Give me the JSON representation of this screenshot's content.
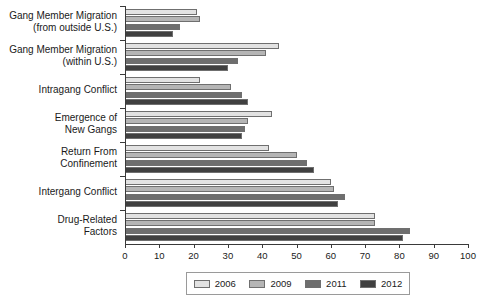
{
  "chart_data": {
    "type": "bar",
    "orientation": "horizontal",
    "title": "",
    "subtitle": "",
    "xlabel": "",
    "ylabel": "",
    "xlim": [
      0,
      100
    ],
    "xticks": [
      0,
      10,
      20,
      30,
      40,
      50,
      60,
      70,
      80,
      90,
      100
    ],
    "xtick_labels": [
      "0",
      "10",
      "20",
      "30",
      "40",
      "50",
      "60",
      "70",
      "80",
      "90",
      "100"
    ],
    "grid": false,
    "legend_position": "bottom",
    "categories": [
      "Gang Member Migration\n(from outside U.S.)",
      "Gang Member Migration\n(within U.S.)",
      "Intragang Conflict",
      "Emergence of\nNew Gangs",
      "Return From\nConfinement",
      "Intergang Conflict",
      "Drug-Related\nFactors"
    ],
    "series": [
      {
        "name": "2006",
        "color": "#e2e2e2",
        "values": [
          21,
          45,
          22,
          43,
          42,
          60,
          73
        ]
      },
      {
        "name": "2009",
        "color": "#b5b5b5",
        "values": [
          22,
          41,
          31,
          36,
          50,
          61,
          73
        ]
      },
      {
        "name": "2011",
        "color": "#6e6e6e",
        "values": [
          16,
          33,
          34,
          35,
          53,
          64,
          83
        ]
      },
      {
        "name": "2012",
        "color": "#404040",
        "values": [
          14,
          30,
          36,
          34,
          55,
          62,
          81
        ]
      }
    ]
  },
  "legend": {
    "items": [
      {
        "label": "2006"
      },
      {
        "label": "2009"
      },
      {
        "label": "2011"
      },
      {
        "label": "2012"
      }
    ]
  }
}
